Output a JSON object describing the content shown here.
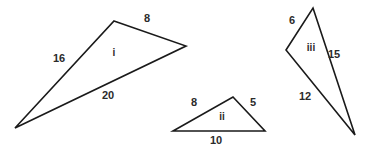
{
  "figure": {
    "width": 370,
    "height": 151,
    "background_color": "#ffffff",
    "stroke_color": "#1a1a1a",
    "text_color": "#2b2b2b"
  },
  "triangles": [
    {
      "id": "triangle-i",
      "name": "i",
      "name_x": 114,
      "name_y": 56,
      "points": "114,21 186,46 15,128",
      "sides": [
        {
          "value": "8",
          "x": 147,
          "y": 22,
          "name": "side-label-8"
        },
        {
          "value": "16",
          "x": 59,
          "y": 62,
          "name": "side-label-16"
        },
        {
          "value": "20",
          "x": 108,
          "y": 99,
          "name": "side-label-20"
        }
      ]
    },
    {
      "id": "triangle-ii",
      "name": "ii",
      "name_x": 222,
      "name_y": 120,
      "points": "233,97 265,131 173,131",
      "sides": [
        {
          "value": "8",
          "x": 194,
          "y": 106,
          "name": "side-label-8"
        },
        {
          "value": "5",
          "x": 253,
          "y": 106,
          "name": "side-label-5"
        },
        {
          "value": "10",
          "x": 216,
          "y": 144,
          "name": "side-label-10"
        }
      ]
    },
    {
      "id": "triangle-iii",
      "name": "iii",
      "name_x": 311,
      "name_y": 51,
      "points": "313,8 355,135 286,50",
      "sides": [
        {
          "value": "6",
          "x": 292,
          "y": 24,
          "name": "side-label-6"
        },
        {
          "value": "15",
          "x": 334,
          "y": 58,
          "name": "side-label-15"
        },
        {
          "value": "12",
          "x": 305,
          "y": 100,
          "name": "side-label-12"
        }
      ]
    }
  ]
}
